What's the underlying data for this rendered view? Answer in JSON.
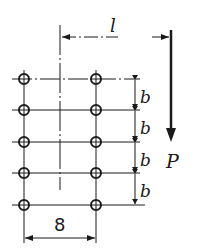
{
  "diagram": {
    "type": "bolted joint / bolt group under eccentric load",
    "labels": {
      "eccentricity": "l",
      "row_spacing": [
        "b",
        "b",
        "b",
        "b"
      ],
      "column_spacing": "8",
      "load": "P"
    },
    "bolts": {
      "columns": 2,
      "rows": 5,
      "count": 10
    },
    "colors": {
      "ink": "#1a1a1a",
      "background": "#ffffff"
    }
  }
}
